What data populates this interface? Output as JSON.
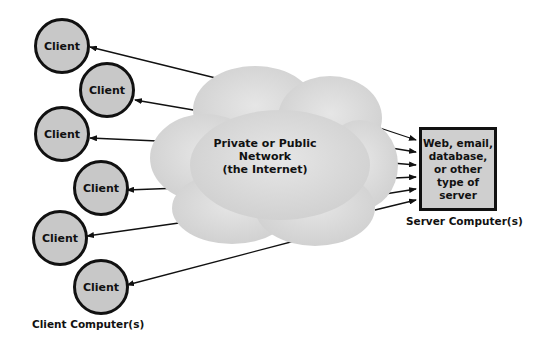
{
  "diagram": {
    "type": "client-server network",
    "cloud": {
      "label_lines": [
        "Private or Public",
        "Network",
        "(the Internet)"
      ],
      "fill": "#d9d9d9"
    },
    "clients": [
      {
        "label": "Client"
      },
      {
        "label": "Client"
      },
      {
        "label": "Client"
      },
      {
        "label": "Client"
      },
      {
        "label": "Client"
      },
      {
        "label": "Client"
      }
    ],
    "server": {
      "label_lines": [
        "Web, email,",
        "database,",
        "or other",
        "type of",
        "server"
      ]
    },
    "captions": {
      "clients": "Client Computer(s)",
      "server": "Server Computer(s)"
    },
    "colors": {
      "circle_fill": "#c8c8c8",
      "outline": "#111111",
      "server_fill": "#cfcfcf"
    }
  }
}
